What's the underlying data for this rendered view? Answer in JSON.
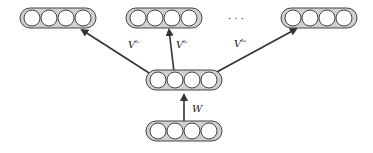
{
  "diagram": {
    "type": "neural-network-multitask",
    "layers": [
      {
        "id": "input",
        "units": 4,
        "x": 150,
        "y": 131
      },
      {
        "id": "hidden",
        "units": 4,
        "x": 150,
        "y": 82
      },
      {
        "id": "output-1",
        "units": 4,
        "x": 22,
        "y": 16
      },
      {
        "id": "output-2",
        "units": 4,
        "x": 128,
        "y": 16
      },
      {
        "id": "output-m",
        "units": 4,
        "x": 284,
        "y": 16
      }
    ],
    "edges": [
      {
        "from": "input",
        "to": "hidden",
        "label": "W"
      },
      {
        "from": "hidden",
        "to": "output-1",
        "label": "V",
        "sup": "t1"
      },
      {
        "from": "hidden",
        "to": "output-2",
        "label": "V",
        "sup": "t2"
      },
      {
        "from": "hidden",
        "to": "output-m",
        "label": "V",
        "sup": "tm"
      }
    ],
    "ellipsis": "· · ·"
  },
  "labels": {
    "w": "W",
    "v1": "V",
    "v1_sup": "t₁",
    "v2": "V",
    "v2_sup": "t₂",
    "vm": "V",
    "vm_sup": "tₘ",
    "ellipsis": "· · ·"
  },
  "colors": {
    "layer_fill": "#d0d0d0",
    "node_fill": "#ffffff",
    "stroke": "#333333"
  }
}
